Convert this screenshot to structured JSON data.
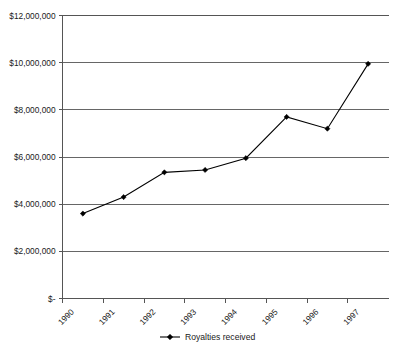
{
  "chart_data": {
    "type": "line",
    "title": "",
    "xlabel": "",
    "ylabel": "",
    "categories": [
      "1990",
      "1991",
      "1992",
      "1993",
      "1994",
      "1995",
      "1996",
      "1997"
    ],
    "series": [
      {
        "name": "Royalties received",
        "values": [
          3600000,
          4300000,
          5350000,
          5450000,
          5950000,
          7700000,
          7200000,
          9950000
        ],
        "marker": "diamond",
        "color": "#000000"
      }
    ],
    "ylim": [
      0,
      12000000
    ],
    "ytick_values": [
      0,
      2000000,
      4000000,
      6000000,
      8000000,
      10000000,
      12000000
    ],
    "ytick_labels": [
      "$-",
      "$2,000,000",
      "$4,000,000",
      "$6,000,000",
      "$8,000,000",
      "$10,000,000",
      "$12,000,000"
    ],
    "grid": "horizontal",
    "legend_position": "bottom",
    "legend_entries": [
      "Royalties received"
    ],
    "xtick_rotation": 45,
    "background_color": "#ffffff",
    "axis_color": "#555555",
    "gridline_color": "#666666"
  },
  "legend": {
    "label": "Royalties received"
  }
}
